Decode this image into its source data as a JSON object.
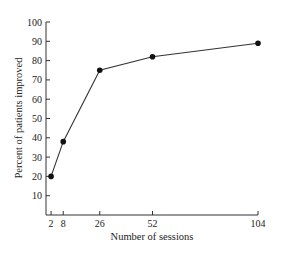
{
  "chart_data": {
    "type": "line",
    "title": "",
    "xlabel": "Number of sessions",
    "ylabel": "Percent of patients improved",
    "x": [
      2,
      8,
      26,
      52,
      104
    ],
    "series": [
      {
        "name": "Percent of patients improved",
        "values": [
          20,
          38,
          75,
          82,
          89
        ],
        "color": "#111111"
      }
    ],
    "x_ticks": [
      2,
      8,
      26,
      52,
      104
    ],
    "y_ticks": [
      10,
      20,
      30,
      40,
      50,
      60,
      70,
      80,
      90,
      100
    ],
    "xlim": [
      0,
      104
    ],
    "ylim": [
      0,
      100
    ],
    "grid": false,
    "legend": "none",
    "marker": "filled-circle"
  }
}
